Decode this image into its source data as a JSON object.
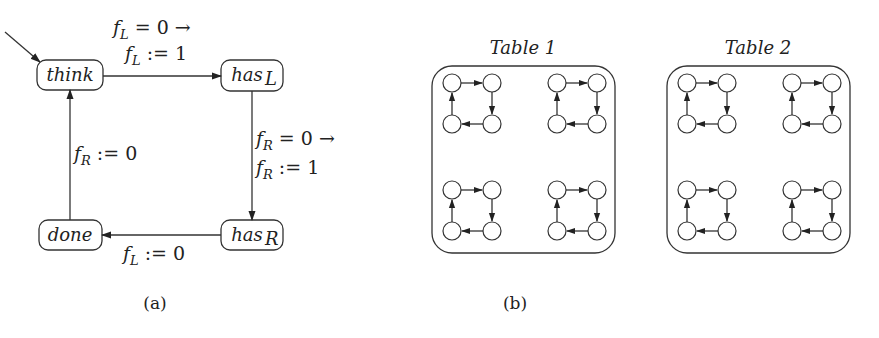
{
  "panel_a": {
    "caption": "(a)",
    "states": [
      {
        "id": "think",
        "label": "think",
        "sub": ""
      },
      {
        "id": "hasL",
        "label": "has",
        "sub": "L"
      },
      {
        "id": "hasR",
        "label": "has",
        "sub": "R"
      },
      {
        "id": "done",
        "label": "done",
        "sub": ""
      }
    ],
    "initial_state": "think",
    "transitions": [
      {
        "from": "think",
        "to": "hasL",
        "guard": "= 0 →",
        "guard_var": "f",
        "guard_sub": "L",
        "action": ":= 1",
        "action_var": "f",
        "action_sub": "L"
      },
      {
        "from": "hasL",
        "to": "hasR",
        "guard": "= 0 →",
        "guard_var": "f",
        "guard_sub": "R",
        "action": ":= 1",
        "action_var": "f",
        "action_sub": "R"
      },
      {
        "from": "hasR",
        "to": "done",
        "action": ":= 0",
        "action_var": "f",
        "action_sub": "L"
      },
      {
        "from": "done",
        "to": "think",
        "action": ":= 0",
        "action_var": "f",
        "action_sub": "R"
      }
    ]
  },
  "panel_b": {
    "caption": "(b)",
    "tables": [
      {
        "title": "Table 1",
        "cycles": 4,
        "direction": "clockwise"
      },
      {
        "title": "Table 2",
        "cycles": 4,
        "direction": "clockwise"
      }
    ]
  }
}
